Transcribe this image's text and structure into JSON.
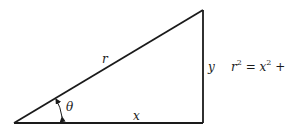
{
  "diagram": {
    "type": "right-triangle",
    "colors": {
      "stroke": "#1a1a1a",
      "background": "#ffffff"
    },
    "vertices": {
      "origin": [
        14,
        123
      ],
      "right_angle": [
        203,
        123
      ],
      "apex": [
        203,
        10
      ]
    },
    "labels": {
      "hypotenuse": "r",
      "base": "x",
      "height": "y",
      "angle": "θ"
    },
    "equation": {
      "lhs_base": "r",
      "lhs_exp": "2",
      "eq": " = ",
      "t1_base": "x",
      "t1_exp": "2",
      "plus": " + ",
      "t2_base": "y",
      "t2_exp": "2",
      "text": "r² = x² + y²"
    }
  }
}
